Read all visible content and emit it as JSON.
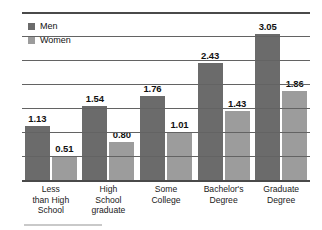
{
  "chart_data": {
    "type": "bar",
    "title": "",
    "subtitle": "",
    "xlabel": "",
    "ylabel": "",
    "categories": [
      "Less than High School",
      "High School graduate",
      "Some College",
      "Bachelor's Degree",
      "Graduate Degree"
    ],
    "category_lines": [
      [
        "Less",
        "than High",
        "School"
      ],
      [
        "High",
        "School",
        "graduate"
      ],
      [
        "Some",
        "College"
      ],
      [
        "Bachelor's",
        "Degree"
      ],
      [
        "Graduate",
        "Degree"
      ]
    ],
    "series": [
      {
        "name": "Men",
        "color": "#6b6b6b",
        "values": [
          1.13,
          1.54,
          1.76,
          2.43,
          3.05
        ],
        "labels": [
          "1.13",
          "1.54",
          "1.76",
          "2.43",
          "3.05"
        ]
      },
      {
        "name": "Women",
        "color": "#9c9c9c",
        "values": [
          0.51,
          0.8,
          1.01,
          1.43,
          1.86
        ],
        "labels": [
          "0.51",
          "0.80",
          "1.01",
          "1.43",
          "1.86"
        ]
      }
    ],
    "ylim": [
      0,
      3.5
    ],
    "gridlines": [
      0.5,
      1.0,
      1.5,
      2.0,
      2.5,
      3.0,
      3.5
    ],
    "grid": true,
    "axis_tick_labels": [],
    "legend": {
      "position": "top-left",
      "entries": [
        {
          "label": "Men",
          "color": "#6b6b6b"
        },
        {
          "label": "Women",
          "color": "#9c9c9c"
        }
      ]
    }
  },
  "colors": {
    "men": "#6b6b6b",
    "women": "#9c9c9c",
    "gridline": "#636363",
    "axis": "#4a4a4a",
    "text": "#111111",
    "background": "#ffffff"
  }
}
